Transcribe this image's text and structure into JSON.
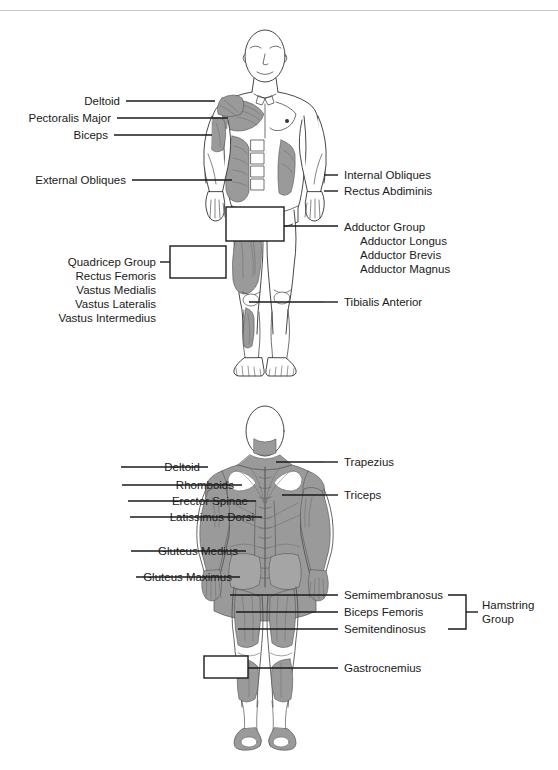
{
  "page": {
    "background": "#ffffff",
    "ink": "#1a1a1a",
    "muscle_fill": "#9a9a9a",
    "skin_fill": "#ffffff",
    "rule_color": "#c8c8c8"
  },
  "figures": [
    {
      "id": "anterior-figure",
      "view": "anterior",
      "caption": "Front view of human body with anterior muscle groups labeled"
    },
    {
      "id": "posterior-figure",
      "view": "posterior",
      "caption": "Back view of human body with posterior muscle groups labeled"
    }
  ],
  "anterior": {
    "left_labels": [
      {
        "text": "Deltoid"
      },
      {
        "text": "Pectoralis Major"
      },
      {
        "text": "Biceps"
      },
      {
        "text": "External Obliques"
      }
    ],
    "quadricep_group": {
      "heading": "Quadricep Group",
      "members": [
        "Rectus Femoris",
        "Vastus Medialis",
        "Vastus Lateralis",
        "Vastus Intermedius"
      ]
    },
    "right_labels": [
      {
        "text": "Internal Obliques"
      },
      {
        "text": "Rectus Abdiminis"
      }
    ],
    "adductor_group": {
      "heading": "Adductor Group",
      "members": [
        "Adductor Longus",
        "Adductor Brevis",
        "Adductor Magnus"
      ]
    },
    "lower_right_labels": [
      {
        "text": "Tibialis Anterior"
      }
    ]
  },
  "posterior": {
    "left_labels": [
      {
        "text": "Deltoid"
      },
      {
        "text": "Rhomboids"
      },
      {
        "text": "Erector Spinae"
      },
      {
        "text": "Latissimus Dorsi"
      },
      {
        "text": "Gluteus Medius"
      },
      {
        "text": "Gluteus Maximus"
      }
    ],
    "right_upper_labels": [
      {
        "text": "Trapezius"
      },
      {
        "text": "Triceps"
      }
    ],
    "hamstring_group": {
      "members": [
        "Semimembranosus",
        "Biceps Femoris",
        "Semitendinosus"
      ],
      "bracket_label_line1": "Hamstring",
      "bracket_label_line2": "Group"
    },
    "lower_right_labels": [
      {
        "text": "Gastrocnemius"
      }
    ]
  }
}
